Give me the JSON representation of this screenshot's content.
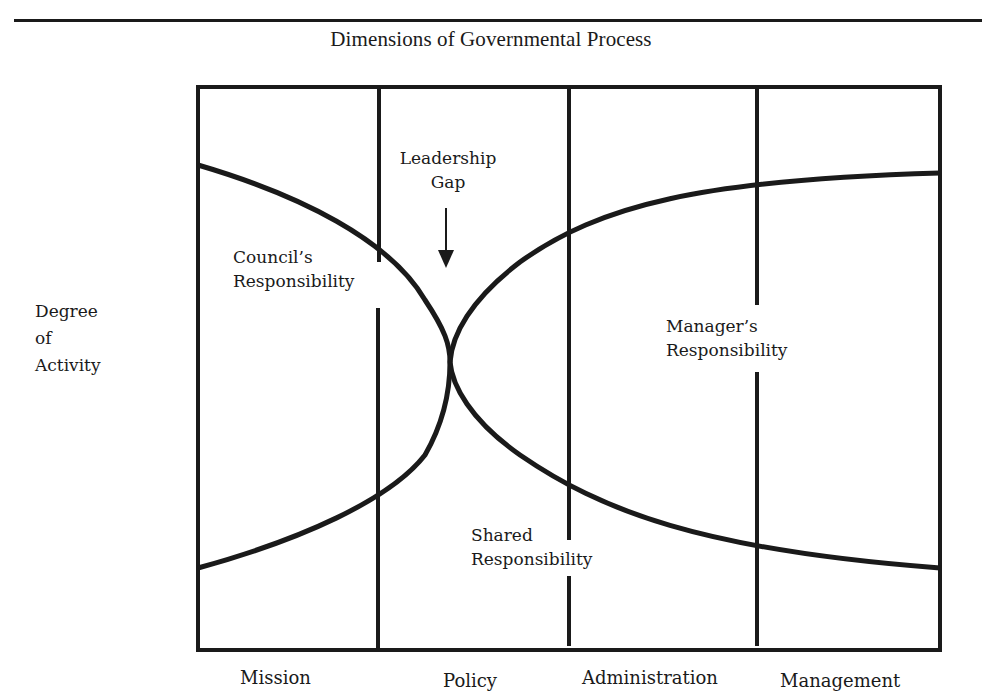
{
  "title": "Dimensions of Governmental Process",
  "y_axis_label": [
    "Degree",
    "of",
    "Activity"
  ],
  "x_axis_categories": [
    "Mission",
    "Policy",
    "Administration",
    "Management"
  ],
  "annotations": {
    "leadership_gap": [
      "Leadership",
      "Gap"
    ],
    "council": [
      "Council’s",
      "Responsibility"
    ],
    "manager": [
      "Manager’s",
      "Responsibility"
    ],
    "shared": [
      "Shared",
      "Responsibility"
    ]
  },
  "colors": {
    "line": "#1a1a1a",
    "background": "#ffffff"
  }
}
